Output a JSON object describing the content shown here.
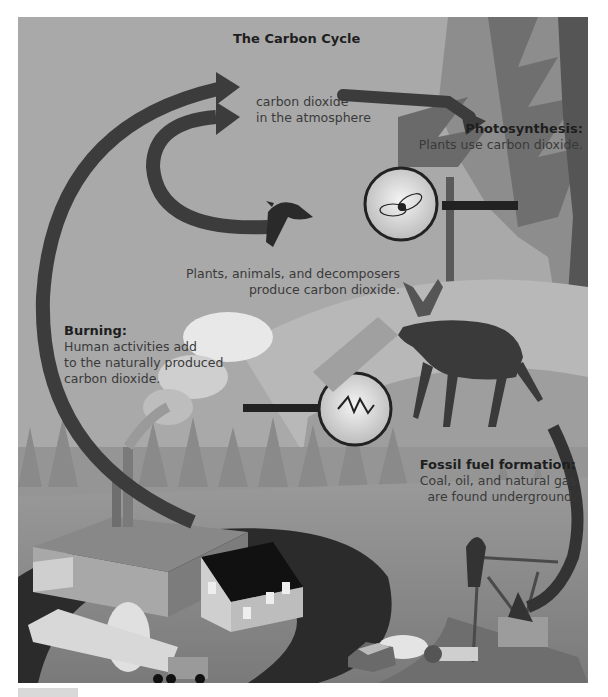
{
  "diagram": {
    "title": "The Carbon Cycle",
    "atmosphere": {
      "line1": "carbon dioxide",
      "line2": "in the atmosphere"
    },
    "photosynthesis": {
      "heading": "Photosynthesis:",
      "text": "Plants use carbon dioxide."
    },
    "respiration": {
      "line1": "Plants, animals, and decomposers",
      "line2": "produce carbon dioxide."
    },
    "burning": {
      "heading": "Burning:",
      "line1": "Human activities add",
      "line2": "to the naturally produced",
      "line3": "carbon dioxide."
    },
    "fossil_fuel": {
      "heading": "Fossil fuel formation:",
      "line1": "Coal, oil, and natural gas",
      "line2": "are found underground."
    },
    "illustrations": [
      "raven",
      "insect-magnifier",
      "decomposer-magnifier",
      "moose",
      "evergreen-trees",
      "factory-smokestacks",
      "house",
      "truck",
      "car",
      "oil-pump-jack"
    ],
    "colors": {
      "background": "#a9a9a9",
      "arrow": "#3c3c3c",
      "ground_dark": "#2a2a2a",
      "text": "#3a3a3a"
    }
  }
}
